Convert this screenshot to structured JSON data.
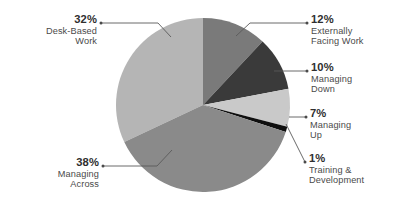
{
  "chart_data": {
    "type": "pie",
    "title": "",
    "subtitle": "",
    "xlabel": "",
    "ylabel": "",
    "legend_position": "callout-labels",
    "grid": false,
    "units": "percent",
    "total": 100,
    "categories": [
      "Externally Facing Work",
      "Managing Down",
      "Managing Up",
      "Training & Development",
      "Managing Across",
      "Desk-Based Work"
    ],
    "values": [
      12,
      10,
      7,
      1,
      38,
      32
    ],
    "slices": [
      {
        "id": "externally-facing-work",
        "percent_label": "12%",
        "name_line1": "Externally",
        "name_line2": "Facing Work",
        "value": 12,
        "color": "#7a7a7a",
        "start_deg": 0,
        "end_deg": 43.2
      },
      {
        "id": "managing-down",
        "percent_label": "10%",
        "name_line1": "Managing",
        "name_line2": "Down",
        "value": 10,
        "color": "#3a3a3a",
        "start_deg": 43.2,
        "end_deg": 79.2
      },
      {
        "id": "managing-up",
        "percent_label": "7%",
        "name_line1": "Managing",
        "name_line2": "Up",
        "value": 7,
        "color": "#c9c9c9",
        "start_deg": 79.2,
        "end_deg": 104.4
      },
      {
        "id": "training-and-development",
        "percent_label": "1%",
        "name_line1": "Training &",
        "name_line2": "Development",
        "value": 1,
        "color": "#0f0f0f",
        "start_deg": 104.4,
        "end_deg": 108.0
      },
      {
        "id": "managing-across",
        "percent_label": "38%",
        "name_line1": "Managing",
        "name_line2": "Across",
        "value": 38,
        "color": "#8a8a8a",
        "start_deg": 108.0,
        "end_deg": 244.8
      },
      {
        "id": "desk-based-work",
        "percent_label": "32%",
        "name_line1": "Desk-Based",
        "name_line2": "Work",
        "value": 32,
        "color": "#b5b5b5",
        "start_deg": 244.8,
        "end_deg": 360.0
      }
    ],
    "colors": {
      "externally_facing_work": "#7a7a7a",
      "managing_down": "#3a3a3a",
      "managing_up": "#c9c9c9",
      "training_and_development": "#0f0f0f",
      "managing_across": "#8a8a8a",
      "desk_based_work": "#b5b5b5",
      "leader_line": "#5a5a5a",
      "label_text": "#3d3d3d",
      "background": "#ffffff"
    }
  },
  "labels": {
    "desk_based_work": {
      "percent": "32%",
      "line1": "Desk-Based",
      "line2": "Work"
    },
    "externally_facing_work": {
      "percent": "12%",
      "line1": "Externally",
      "line2": "Facing Work"
    },
    "managing_down": {
      "percent": "10%",
      "line1": "Managing",
      "line2": "Down"
    },
    "managing_up": {
      "percent": "7%",
      "line1": "Managing",
      "line2": "Up"
    },
    "training_and_development": {
      "percent": "1%",
      "line1": "Training &",
      "line2": "Development"
    },
    "managing_across": {
      "percent": "38%",
      "line1": "Managing",
      "line2": "Across"
    }
  }
}
